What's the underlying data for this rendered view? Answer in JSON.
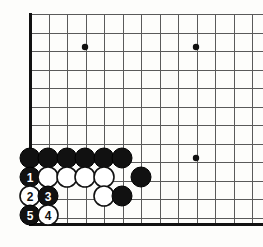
{
  "diagram": {
    "type": "go-board-joseki-diagram",
    "background_color": "#fdfdfb",
    "line_color": "#5a5a5a",
    "border_color": "#111111",
    "black_stone_color": "#111111",
    "white_stone_color": "#ffffff"
  },
  "board": {
    "origin_x": 30,
    "origin_y": 14,
    "spacing": 18.5,
    "cols": 13,
    "rows": 12,
    "left_edge_x": 30,
    "bottom_edge_y": 224,
    "stone_radius": 10,
    "star_radius": 3.2
  },
  "star_points": [
    {
      "name": "star-point-upper-left",
      "col": 3,
      "row": 2,
      "x": 85,
      "y": 47
    },
    {
      "name": "star-point-upper-right",
      "col": 9,
      "row": 2,
      "x": 196,
      "y": 47
    },
    {
      "name": "star-point-lower-right",
      "col": 9,
      "row": 8,
      "x": 196,
      "y": 158
    }
  ],
  "stones": [
    {
      "id": "b-a",
      "color": "black",
      "label": "",
      "col": 0,
      "row": 8,
      "x": 30,
      "y": 158
    },
    {
      "id": "b-b",
      "color": "black",
      "label": "",
      "col": 1,
      "row": 8,
      "x": 48,
      "y": 158
    },
    {
      "id": "b-c",
      "color": "black",
      "label": "",
      "col": 2,
      "row": 8,
      "x": 67,
      "y": 158
    },
    {
      "id": "b-d",
      "color": "black",
      "label": "",
      "col": 3,
      "row": 8,
      "x": 85,
      "y": 158
    },
    {
      "id": "b-e",
      "color": "black",
      "label": "",
      "col": 4,
      "row": 8,
      "x": 104,
      "y": 158
    },
    {
      "id": "b-f",
      "color": "black",
      "label": "",
      "col": 5,
      "row": 8,
      "x": 122,
      "y": 158
    },
    {
      "id": "m1",
      "color": "black",
      "label": "1",
      "col": 0,
      "row": 9,
      "x": 30,
      "y": 177
    },
    {
      "id": "w-a",
      "color": "white",
      "label": "",
      "col": 1,
      "row": 9,
      "x": 48,
      "y": 177
    },
    {
      "id": "w-b",
      "color": "white",
      "label": "",
      "col": 2,
      "row": 9,
      "x": 67,
      "y": 177
    },
    {
      "id": "w-c",
      "color": "white",
      "label": "",
      "col": 3,
      "row": 9,
      "x": 85,
      "y": 177
    },
    {
      "id": "w-d",
      "color": "white",
      "label": "",
      "col": 4,
      "row": 9,
      "x": 104,
      "y": 177
    },
    {
      "id": "b-g",
      "color": "black",
      "label": "",
      "col": 6,
      "row": 9,
      "x": 141,
      "y": 177
    },
    {
      "id": "m2",
      "color": "white",
      "label": "2",
      "col": 0,
      "row": 10,
      "x": 30,
      "y": 196
    },
    {
      "id": "m3",
      "color": "black",
      "label": "3",
      "col": 1,
      "row": 10,
      "x": 48,
      "y": 196
    },
    {
      "id": "w-e",
      "color": "white",
      "label": "",
      "col": 4,
      "row": 10,
      "x": 104,
      "y": 196
    },
    {
      "id": "b-h",
      "color": "black",
      "label": "",
      "col": 5,
      "row": 10,
      "x": 122,
      "y": 196
    },
    {
      "id": "m5",
      "color": "black",
      "label": "5",
      "col": 0,
      "row": 11,
      "x": 30,
      "y": 215
    },
    {
      "id": "m4",
      "color": "white",
      "label": "4",
      "col": 1,
      "row": 11,
      "x": 48,
      "y": 215
    }
  ],
  "move_sequence": [
    {
      "number": "1",
      "color": "black"
    },
    {
      "number": "2",
      "color": "white"
    },
    {
      "number": "3",
      "color": "black"
    },
    {
      "number": "4",
      "color": "white"
    },
    {
      "number": "5",
      "color": "black"
    }
  ]
}
